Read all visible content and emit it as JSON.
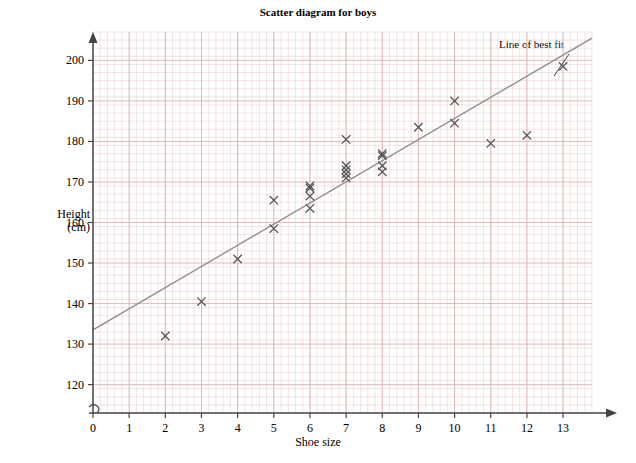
{
  "chart_data": {
    "type": "scatter",
    "title": "Scatter diagram for boys",
    "xlabel": "Shoe size",
    "ylabel": "Height\n(cm)",
    "ylabel_line1": "Height",
    "ylabel_line2": "(cm)",
    "xlim": [
      0,
      13.8
    ],
    "ylim": [
      113,
      207
    ],
    "xticks": [
      0,
      1,
      2,
      3,
      4,
      5,
      6,
      7,
      8,
      9,
      10,
      11,
      12,
      13
    ],
    "xticklabels": [
      "0",
      "1",
      "2",
      "3",
      "4",
      "5",
      "6",
      "7",
      "8",
      "9",
      "10",
      "11",
      "12",
      "13"
    ],
    "yticks": [
      120,
      130,
      140,
      150,
      160,
      170,
      180,
      190,
      200
    ],
    "yticklabels": [
      "120",
      "130",
      "140",
      "150",
      "160",
      "170",
      "180",
      "190",
      "200"
    ],
    "grid": true,
    "grid_color": "#e8c9c9",
    "marker": "x",
    "marker_color": "#555555",
    "line_color": "#8a8a8a",
    "axis_color": "#444444",
    "y_axis_break": true,
    "points": [
      {
        "x": 2,
        "y": 132
      },
      {
        "x": 3,
        "y": 140.5
      },
      {
        "x": 4,
        "y": 151
      },
      {
        "x": 5,
        "y": 165.5
      },
      {
        "x": 5,
        "y": 158.5
      },
      {
        "x": 6,
        "y": 169
      },
      {
        "x": 6,
        "y": 168.5
      },
      {
        "x": 6,
        "y": 166.5
      },
      {
        "x": 6,
        "y": 163.5
      },
      {
        "x": 7,
        "y": 180.5
      },
      {
        "x": 7,
        "y": 174
      },
      {
        "x": 7,
        "y": 173
      },
      {
        "x": 7,
        "y": 172
      },
      {
        "x": 7,
        "y": 171
      },
      {
        "x": 8,
        "y": 177
      },
      {
        "x": 8,
        "y": 176.5
      },
      {
        "x": 8,
        "y": 174
      },
      {
        "x": 8,
        "y": 172.5
      },
      {
        "x": 9,
        "y": 183.5
      },
      {
        "x": 10,
        "y": 190
      },
      {
        "x": 10,
        "y": 184.5
      },
      {
        "x": 11,
        "y": 179.5
      },
      {
        "x": 12,
        "y": 181.5
      },
      {
        "x": 13,
        "y": 198.5
      }
    ],
    "best_fit_line": {
      "label": "Line of best fit",
      "x0": 0,
      "y0": 133.5,
      "x1": 13.8,
      "y1": 205.5
    },
    "annotation": {
      "text": "Line of best fit",
      "leader_from": [
        569,
        54
      ],
      "leader_to": [
        554,
        76
      ]
    }
  }
}
